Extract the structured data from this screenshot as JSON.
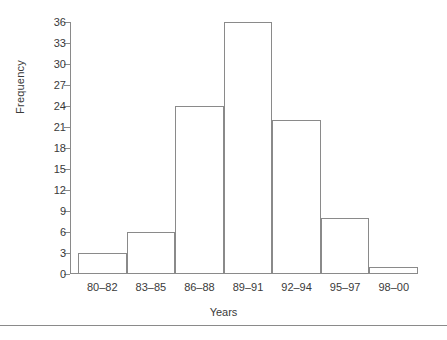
{
  "chart_data": {
    "type": "bar",
    "title": "",
    "subtitle": "",
    "xlabel": "Years",
    "ylabel": "Frequency",
    "categories": [
      "80–82",
      "83–85",
      "86–88",
      "89–91",
      "92–94",
      "95–97",
      "98–00"
    ],
    "values": [
      3,
      6,
      24,
      36,
      22,
      8,
      1
    ],
    "ylim": [
      0,
      36
    ],
    "yticks": [
      0,
      3,
      6,
      9,
      12,
      15,
      18,
      21,
      24,
      27,
      30,
      33,
      36
    ],
    "ytick_labels": [
      "0",
      "3",
      "6",
      "9",
      "12",
      "15",
      "18",
      "21",
      "24",
      "27",
      "30",
      "33",
      "36"
    ],
    "grid": false,
    "legend": null,
    "legend_position": "none",
    "annotations": [],
    "style": {
      "bar_fill": "#ffffff",
      "bar_edge": "#8a8a8a",
      "axis_color": "#8a8a8a",
      "text_color": "#3a3a3a",
      "background": "#ffffff",
      "bar_gap": 0
    }
  }
}
